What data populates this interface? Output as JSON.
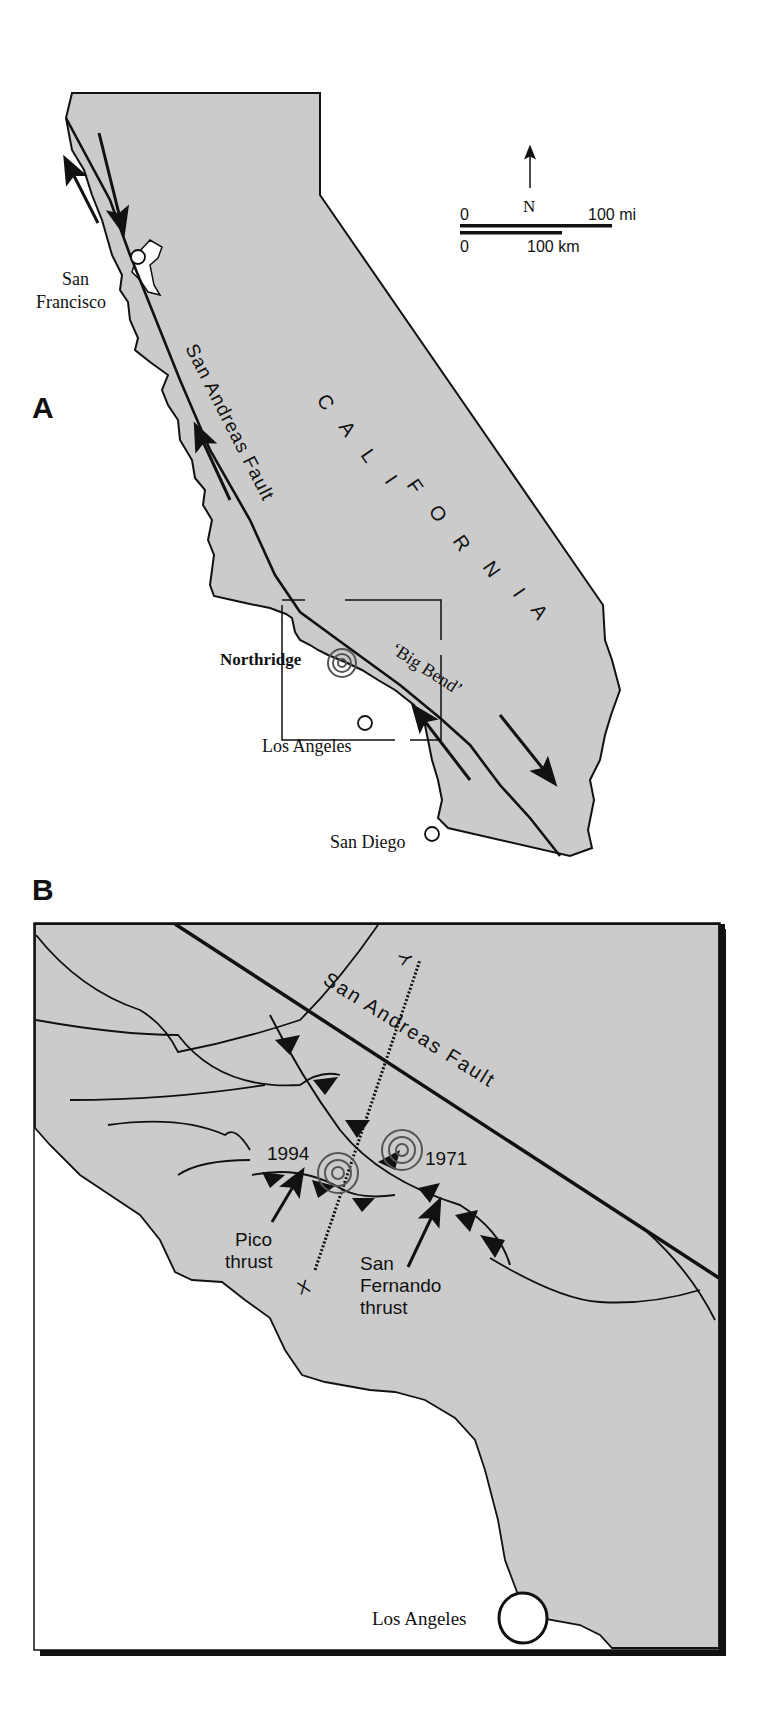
{
  "figure": {
    "panel_a": {
      "label": "A",
      "state_label": "CALIFORNIA",
      "state_letters": [
        "C",
        "A",
        "L",
        "I",
        "F",
        "O",
        "R",
        "N",
        "I",
        "A"
      ],
      "fault_label": "San Andreas Fault",
      "big_bend_label": "‘Big Bend’",
      "cities": {
        "san_francisco_1": "San",
        "san_francisco_2": "Francisco",
        "los_angeles": "Los Angeles",
        "san_diego": "San Diego"
      },
      "epicenter_label": "Northridge",
      "north_label": "N",
      "scale": {
        "mi_zero": "0",
        "mi_label": "100 mi",
        "km_zero": "0",
        "km_label": "100 km"
      }
    },
    "panel_b": {
      "label": "B",
      "fault_label": "San Andreas Fault",
      "quake_1994": "1994",
      "quake_1971": "1971",
      "pico_1": "Pico",
      "pico_2": "thrust",
      "sf_1": "San",
      "sf_2": "Fernando",
      "sf_3": "thrust",
      "section_start": "X",
      "section_end": "Y",
      "city": "Los Angeles"
    },
    "colors": {
      "land": "#cbcbcb",
      "ink": "#111111",
      "epicenter": "#555555",
      "water": "#ffffff"
    }
  }
}
